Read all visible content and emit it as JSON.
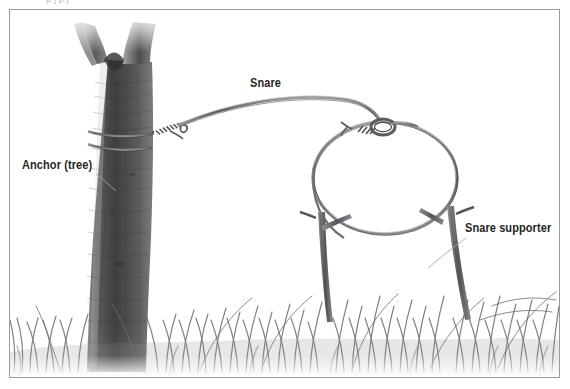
{
  "figure": {
    "kind": "pencil-illustration",
    "top_caption_fragment": "p          j           p            j",
    "background_color": "#ffffff",
    "frame_color": "#9a9a9e",
    "ink_color": "#262626",
    "wire_color": "#6b6b70",
    "trunk_dark": "#4a4a4c",
    "trunk_mid": "#6e6e72",
    "grass_color": "#7a7a80"
  },
  "labels": [
    {
      "id": "anchor",
      "text": "Anchor (tree)",
      "x": 22,
      "y": 158,
      "leader": true
    },
    {
      "id": "snare",
      "text": "Snare",
      "x": 250,
      "y": 76,
      "leader": false
    },
    {
      "id": "supporter",
      "text": "Snare supporter",
      "x": 465,
      "y": 221,
      "leader": true
    }
  ],
  "parts": [
    {
      "name": "tree-trunk",
      "note": "forked trunk rising from grass at left, dark bark shading"
    },
    {
      "name": "anchor-wrap",
      "note": "snare wire wrapped twice around trunk and twisted off"
    },
    {
      "name": "snare-lead-wire",
      "note": "long wire arcing from trunk to slip-knot at loop top"
    },
    {
      "name": "slip-knot",
      "note": "coiled twist forming the running loop eye"
    },
    {
      "name": "snare-loop",
      "note": "large circular wire noose hanging above ground"
    },
    {
      "name": "supporter-stick-left",
      "note": "forked stick propping left side of loop"
    },
    {
      "name": "supporter-stick-right",
      "note": "forked stick propping right side of loop"
    },
    {
      "name": "grass",
      "note": "band of grass blades across the lower third"
    }
  ]
}
